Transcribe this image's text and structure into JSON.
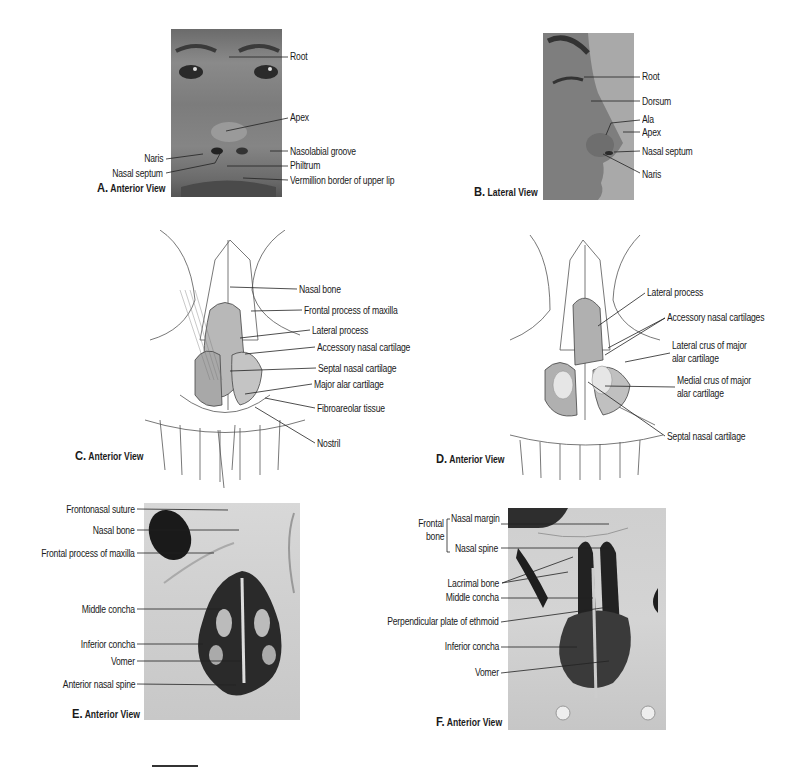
{
  "figure": {
    "panels": [
      {
        "id": "A",
        "caption_letter": "A.",
        "caption_text": "Anterior View",
        "image": "photo-face-anterior",
        "labels": [
          "Root",
          "Apex",
          "Naris",
          "Nasolabial groove",
          "Nasal septum",
          "Philtrum",
          "Vermillion border of upper lip"
        ]
      },
      {
        "id": "B",
        "caption_letter": "B.",
        "caption_text": "Lateral View",
        "image": "photo-face-lateral",
        "labels": [
          "Root",
          "Dorsum",
          "Ala",
          "Apex",
          "Nasal septum",
          "Naris"
        ]
      },
      {
        "id": "C",
        "caption_letter": "C.",
        "caption_text": "Anterior View",
        "image": "drawing-nasal-cartilages",
        "labels": [
          "Nasal bone",
          "Frontal process of maxilla",
          "Lateral process",
          "Accessory nasal cartilage",
          "Septal nasal cartilage",
          "Major alar cartilage",
          "Fibroareolar tissue",
          "Nostril"
        ]
      },
      {
        "id": "D",
        "caption_letter": "D.",
        "caption_text": "Anterior View",
        "image": "drawing-nasal-cartilages-retracted",
        "labels": [
          "Lateral process",
          "Accessory nasal cartilages",
          "Lateral crus of major",
          "alar cartilage",
          "Medial crus of major",
          "alar cartilage",
          "Septal nasal cartilage"
        ]
      },
      {
        "id": "E",
        "caption_letter": "E.",
        "caption_text": "Anterior View",
        "image": "photo-skull-piriform-aperture",
        "labels": [
          "Frontonasal suture",
          "Nasal bone",
          "Frontal process of maxilla",
          "Middle concha",
          "Inferior concha",
          "Vomer",
          "Anterior nasal spine"
        ]
      },
      {
        "id": "F",
        "caption_letter": "F.",
        "caption_text": "Anterior View",
        "image": "photo-skull-nasal-bones-removed",
        "group_label": [
          "Frontal",
          "bone"
        ],
        "labels": [
          "Nasal margin",
          "Nasal spine",
          "Lacrimal bone",
          "Middle concha",
          "Perpendicular plate of ethmoid",
          "Inferior concha",
          "Vomer"
        ]
      }
    ],
    "scale_bar": "scale-bar"
  }
}
